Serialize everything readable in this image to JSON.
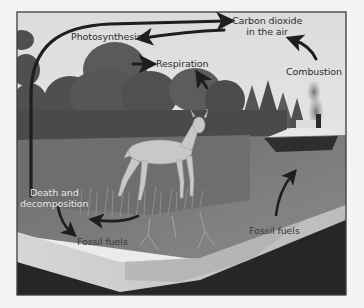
{
  "diagram": {
    "style": "grayscale illustration",
    "scene_elements": [
      "sky",
      "forest",
      "deer",
      "grass",
      "lake",
      "boat with smoke",
      "soil cross-section"
    ],
    "labels": {
      "carbon_dioxide_line1": "Carbon dioxide",
      "carbon_dioxide_line2": "in the air",
      "photosynthesis": "Photosynthesis",
      "respiration": "Respiration",
      "combustion": "Combustion",
      "death_line1": "Death and",
      "death_line2": "decomposition",
      "fossil_fuels_left": "Fossil fuels",
      "fossil_fuels_right": "Fossil fuels"
    },
    "arrows": [
      {
        "from": "Carbon dioxide in the air",
        "to": "Photosynthesis"
      },
      {
        "from": "Death and decomposition (left loop)",
        "to": "Carbon dioxide in the air"
      },
      {
        "from": "forest",
        "to": "Respiration"
      },
      {
        "from": "forest (below label)",
        "to": "Respiration"
      },
      {
        "from": "Combustion",
        "to": "Carbon dioxide in the air"
      },
      {
        "from": "Death and decomposition",
        "to": "Fossil fuels"
      },
      {
        "from": "grass/deer",
        "to": "Fossil fuels (left)"
      },
      {
        "from": "Fossil fuels (right)",
        "to": "boat"
      }
    ],
    "colors": {
      "background": "#f4f4f4",
      "frame": "#3c3c3c",
      "sky": "#e2e2e2",
      "forest": "#5a5a5a",
      "water": "#7a7a7a",
      "soil_top": "#c9c9c9",
      "soil_deep": "#262626",
      "arrow": "#1e1e1e"
    }
  }
}
